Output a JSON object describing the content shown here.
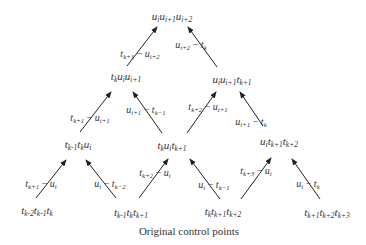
{
  "caption": "Original control points",
  "nodes": [
    {
      "id": "n0",
      "level": 1,
      "x": 172,
      "y": 16,
      "label": "u_i u_{i+1} u_{i+2}"
    },
    {
      "id": "n1",
      "level": 2,
      "x": 126,
      "y": 76,
      "label": "t_k u_i u_{i+1}"
    },
    {
      "id": "n2",
      "level": 2,
      "x": 232,
      "y": 79,
      "label": "u_i u_{i+1} t_{k+1}"
    },
    {
      "id": "n3",
      "level": 3,
      "x": 78,
      "y": 144,
      "label": "t_{k-1} t_k u_i"
    },
    {
      "id": "n4",
      "level": 3,
      "x": 172,
      "y": 145,
      "label": "t_k u_i t_{k+1}"
    },
    {
      "id": "n5",
      "level": 3,
      "x": 279,
      "y": 141,
      "label": "u_i t_{k+1} t_{k+2}"
    },
    {
      "id": "n6",
      "level": 4,
      "x": 37,
      "y": 210,
      "label": "t_{k-2} t_{k-1} t_k"
    },
    {
      "id": "n7",
      "level": 4,
      "x": 131,
      "y": 212,
      "label": "t_{k-1} t_k t_{k+1}"
    },
    {
      "id": "n8",
      "level": 4,
      "x": 223,
      "y": 211,
      "label": "t_k t_{k+1} t_{k+2}"
    },
    {
      "id": "n9",
      "level": 4,
      "x": 327,
      "y": 212,
      "label": "t_{k+1} t_{k+2} t_{k+3}"
    }
  ],
  "edges": [
    {
      "from": "n1",
      "to": "n0",
      "x1": 127,
      "y1": 66,
      "x2": 157,
      "y2": 27,
      "label": "t_{k+1} − u_{i+2}",
      "lx": 140,
      "ly": 53
    },
    {
      "from": "n2",
      "to": "n0",
      "x1": 217,
      "y1": 67,
      "x2": 188,
      "y2": 27,
      "label": "u_{i+2} − t_k",
      "lx": 191,
      "ly": 44
    },
    {
      "from": "n3",
      "to": "n1",
      "x1": 80,
      "y1": 132,
      "x2": 111,
      "y2": 92,
      "label": "t_{k+1} − u_{i+1}",
      "lx": 90,
      "ly": 117
    },
    {
      "from": "n4",
      "to": "n1",
      "x1": 162,
      "y1": 133,
      "x2": 133,
      "y2": 92,
      "label": "u_{i+1} − t_{k−1}",
      "lx": 146,
      "ly": 109
    },
    {
      "from": "n4",
      "to": "n2",
      "x1": 187,
      "y1": 133,
      "x2": 216,
      "y2": 92,
      "label": "t_{k+2} − u_{i+1}",
      "lx": 208,
      "ly": 106
    },
    {
      "from": "n5",
      "to": "n2",
      "x1": 263,
      "y1": 126,
      "x2": 240,
      "y2": 92,
      "label": "u_{i+1} − t_k",
      "lx": 251,
      "ly": 121
    },
    {
      "from": "n6",
      "to": "n3",
      "x1": 36,
      "y1": 198,
      "x2": 66,
      "y2": 160,
      "label": "t_{k+1} − u_i",
      "lx": 41,
      "ly": 183
    },
    {
      "from": "n7",
      "to": "n3",
      "x1": 116,
      "y1": 198,
      "x2": 86,
      "y2": 160,
      "label": "u_i − t_{k−2}",
      "lx": 110,
      "ly": 183
    },
    {
      "from": "n7",
      "to": "n4",
      "x1": 139,
      "y1": 198,
      "x2": 168,
      "y2": 159,
      "label": "t_{k+2} − u_i",
      "lx": 155,
      "ly": 172
    },
    {
      "from": "n8",
      "to": "n4",
      "x1": 220,
      "y1": 199,
      "x2": 190,
      "y2": 159,
      "label": "u_i − t_{k−1}",
      "lx": 214,
      "ly": 184
    },
    {
      "from": "n8",
      "to": "n5",
      "x1": 241,
      "y1": 199,
      "x2": 271,
      "y2": 158,
      "label": "t_{k+3} − u_i",
      "lx": 256,
      "ly": 170
    },
    {
      "from": "n9",
      "to": "n5",
      "x1": 320,
      "y1": 199,
      "x2": 292,
      "y2": 159,
      "label": "u_i − t_k",
      "lx": 308,
      "ly": 183
    }
  ]
}
